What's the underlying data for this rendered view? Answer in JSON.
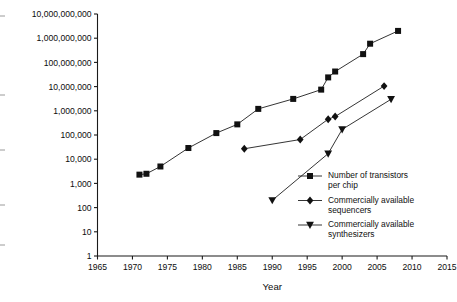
{
  "chart_data": {
    "type": "line",
    "title": "",
    "xlabel": "Year",
    "ylabel": "",
    "xlim": [
      1965,
      2015
    ],
    "ylim": [
      1,
      10000000000
    ],
    "yscale": "log",
    "grid": false,
    "legend_position": "inside-bottom-right",
    "xticks": [
      1965,
      1970,
      1975,
      1980,
      1985,
      1990,
      1995,
      2000,
      2005,
      2010,
      2015
    ],
    "xtick_labels": [
      "1965",
      "1970",
      "1975",
      "1980",
      "1985",
      "1990",
      "1995",
      "2000",
      "2005",
      "2010",
      "2015"
    ],
    "yticks": [
      1,
      10,
      100,
      1000,
      10000,
      100000,
      1000000,
      10000000,
      100000000,
      1000000000,
      10000000000
    ],
    "ytick_labels": [
      "1",
      "10",
      "100",
      "1,000",
      "10,000",
      "100,000",
      "1,000,000",
      "10,000,000",
      "100,000,000",
      "1,000,000,000",
      "10,000,000,000"
    ],
    "series": [
      {
        "name": "Number of transistors per chip",
        "legend_label_line1": "Number of transistors",
        "legend_label_line2": "per chip",
        "marker": "square",
        "color": "#111111",
        "x": [
          1971,
          1972,
          1974,
          1978,
          1982,
          1985,
          1988,
          1993,
          1997,
          1998,
          1999,
          2003,
          2004,
          2008
        ],
        "y": [
          2300,
          2500,
          5000,
          29000,
          120000,
          275000,
          1200000,
          3100000,
          7500000,
          24000000,
          42000000,
          220000000,
          592000000,
          2000000000
        ]
      },
      {
        "name": "Commercially available sequencers",
        "legend_label_line1": "Commercially available",
        "legend_label_line2": "sequencers",
        "marker": "diamond",
        "color": "#111111",
        "x": [
          1986,
          1994,
          1998,
          1999,
          2006
        ],
        "y": [
          27000,
          65000,
          450000,
          580000,
          10500000
        ]
      },
      {
        "name": "Commercially available synthesizers",
        "legend_label_line1": "Commercially available",
        "legend_label_line2": "synthesizers",
        "marker": "triangle-down",
        "color": "#111111",
        "x": [
          1990,
          1998,
          2000,
          2007
        ],
        "y": [
          200,
          17000,
          170000,
          3000000
        ]
      }
    ]
  }
}
